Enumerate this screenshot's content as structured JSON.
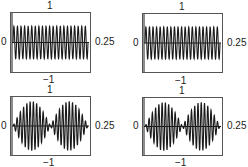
{
  "chart_data": [
    {
      "type": "line",
      "title": "",
      "panel": "top-left",
      "xlabel": "",
      "ylabel": "",
      "xlim": [
        0,
        0.25
      ],
      "ylim": [
        -1,
        1
      ],
      "tick_labels": {
        "x_left": "0",
        "x_right": "0.25",
        "y_top": "1",
        "y_bottom": "−1"
      },
      "description": "Constant-amplitude sinusoid, ~21 cycles over [0, 0.25] (~84 Hz), amplitude ~0.55",
      "signal": {
        "kind": "sine",
        "cycles": 21,
        "amplitude": 0.55
      },
      "grid": false
    },
    {
      "type": "line",
      "title": "",
      "panel": "top-right",
      "xlabel": "",
      "ylabel": "",
      "xlim": [
        0,
        0.25
      ],
      "ylim": [
        -1,
        1
      ],
      "tick_labels": {
        "x_left": "0",
        "x_right": "0.25",
        "y_top": "1",
        "y_bottom": "−1"
      },
      "description": "Constant-amplitude sinusoid, ~21 cycles over [0, 0.25], amplitude ~0.55 (sampled/reconstructed version)",
      "signal": {
        "kind": "sine",
        "cycles": 21,
        "amplitude": 0.55
      },
      "grid": false
    },
    {
      "type": "line",
      "title": "",
      "panel": "bottom-left",
      "xlabel": "",
      "ylabel": "",
      "xlim": [
        0,
        0.25
      ],
      "ylim": [
        -1,
        1
      ],
      "tick_labels": {
        "x_left": "0",
        "x_right": "0.25",
        "y_top": "1",
        "y_bottom": "−1"
      },
      "description": "Beat signal: carrier ~23 cycles with sinusoidal envelope, two lobes (peaks near 0.06 and 0.19), amplitude up to ~0.85",
      "signal": {
        "kind": "beat",
        "cycles": 23,
        "envelope_lobes": 2,
        "amplitude": 0.85
      },
      "grid": false
    },
    {
      "type": "line",
      "title": "",
      "panel": "bottom-right",
      "xlabel": "",
      "ylabel": "",
      "xlim": [
        0,
        0.25
      ],
      "ylim": [
        -1,
        1
      ],
      "tick_labels": {
        "x_left": "0",
        "x_right": "0.25",
        "y_top": "1",
        "y_bottom": "−1"
      },
      "description": "Beat signal: carrier ~23 cycles with sinusoidal envelope, two lobes, amplitude up to ~0.85",
      "signal": {
        "kind": "beat",
        "cycles": 23,
        "envelope_lobes": 2,
        "amplitude": 0.85
      },
      "grid": false
    }
  ],
  "colors": {
    "line": "#1a1a1a",
    "frame": "#555555",
    "axis": "#1a1a1a",
    "background": "#ffffff"
  }
}
